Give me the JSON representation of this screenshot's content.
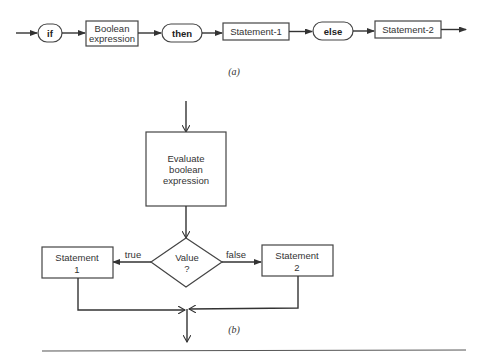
{
  "figure_a": {
    "caption": "(a)",
    "nodes": [
      {
        "id": "if",
        "shape": "rounded",
        "label": "if"
      },
      {
        "id": "bool",
        "shape": "box",
        "label_lines": [
          "Boolean",
          "expression"
        ]
      },
      {
        "id": "then",
        "shape": "rounded",
        "label": "then"
      },
      {
        "id": "stmt1",
        "shape": "box",
        "label": "Statement-1"
      },
      {
        "id": "else",
        "shape": "rounded",
        "label": "else"
      },
      {
        "id": "stmt2",
        "shape": "box",
        "label": "Statement-2"
      }
    ]
  },
  "figure_b": {
    "caption": "(b)",
    "evaluate": {
      "line1": "Evaluate",
      "line2": "boolean",
      "line3": "expression"
    },
    "decision": {
      "line1": "Value",
      "line2": "?"
    },
    "true_label": "true",
    "false_label": "false",
    "stmt1": {
      "line1": "Statement",
      "line2": "1"
    },
    "stmt2": {
      "line1": "Statement",
      "line2": "2"
    }
  }
}
